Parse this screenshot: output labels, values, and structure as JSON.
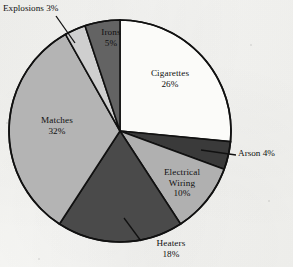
{
  "chart_data": {
    "type": "pie",
    "title": "",
    "subtitle": "",
    "xlabel": "",
    "ylabel": "",
    "legend_position": "none",
    "grid": false,
    "units": "percent",
    "start_angle_deg": 0,
    "direction": "clockwise",
    "categories": [
      "Cigarettes",
      "Arson",
      "Electrical Wiring",
      "Heaters",
      "Matches",
      "Explosions",
      "Irons"
    ],
    "values": [
      26,
      4,
      10,
      18,
      32,
      3,
      5
    ],
    "slices": [
      {
        "name": "Cigarettes",
        "label": "Cigarettes",
        "value": 26,
        "value_text": "26%",
        "color": "#fbfbf9",
        "label_placement": "inside",
        "has_leader_line": false
      },
      {
        "name": "Arson",
        "label": "Arson 4%",
        "value": 4,
        "value_text": "4%",
        "color": "#3a3a3a",
        "label_placement": "outside",
        "has_leader_line": true
      },
      {
        "name": "Electrical Wiring",
        "label": "Electrical Wiring",
        "value": 10,
        "value_text": "10%",
        "color": "#b0b0b0",
        "label_placement": "inside",
        "has_leader_line": false
      },
      {
        "name": "Heaters",
        "label": "Heaters",
        "value": 18,
        "value_text": "18%",
        "color": "#4a4a4a",
        "label_placement": "outside",
        "has_leader_line": true
      },
      {
        "name": "Matches",
        "label": "Matches",
        "value": 32,
        "value_text": "32%",
        "color": "#b4b4b4",
        "label_placement": "inside",
        "has_leader_line": false
      },
      {
        "name": "Explosions",
        "label": "Explosions 3%",
        "value": 3,
        "value_text": "3%",
        "color": "#cfcfcf",
        "label_placement": "outside",
        "has_leader_line": true
      },
      {
        "name": "Irons",
        "label": "Irons",
        "value": 5,
        "value_text": "5%",
        "color": "#636363",
        "label_placement": "inside",
        "has_leader_line": false
      }
    ]
  },
  "labels": {
    "cigarettes_name": "Cigarettes",
    "cigarettes_value": "26%",
    "matches_name": "Matches",
    "matches_value": "32%",
    "heaters_name": "Heaters",
    "heaters_value": "18%",
    "electrical_name_line1": "Electrical",
    "electrical_name_line2": "Wiring",
    "electrical_value": "10%",
    "irons_name": "Irons",
    "irons_value": "5%",
    "arson_callout": "Arson 4%",
    "explosions_callout": "Explosions 3%"
  },
  "geometry": {
    "center_x": 120,
    "center_y": 131,
    "radius": 111
  },
  "colors": {
    "background": "#f7f7f5",
    "outline": "#111111",
    "text": "#111111"
  }
}
